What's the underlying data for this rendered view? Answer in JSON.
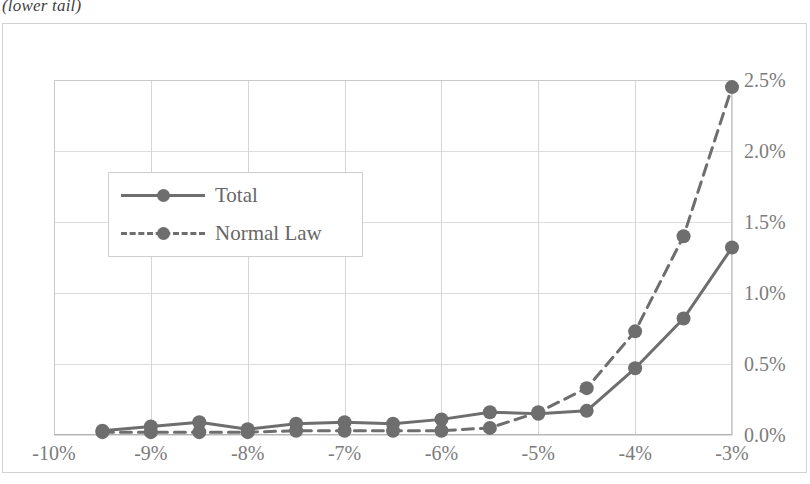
{
  "caption": "(lower tail)",
  "colors": {
    "series": "#6e6e6e",
    "grid": "#dcdcdc",
    "plot_border": "#c9c9c9",
    "frame": "#d2d2d2",
    "tick_text": "#7c7c7c",
    "legend_text": "#676767",
    "background": "#ffffff"
  },
  "legend": {
    "position": "inside-upper-left",
    "items": [
      {
        "label": "Total",
        "style": "solid",
        "marker": "circle"
      },
      {
        "label": "Normal Law",
        "style": "dashed",
        "marker": "circle"
      }
    ]
  },
  "axes": {
    "x_ticks": [
      "-10%",
      "-9%",
      "-8%",
      "-7%",
      "-6%",
      "-5%",
      "-4%",
      "-3%"
    ],
    "y_ticks": [
      "0.0%",
      "0.5%",
      "1.0%",
      "1.5%",
      "2.0%",
      "2.5%"
    ]
  },
  "chart_data": {
    "type": "line",
    "title": "(lower tail)",
    "xlabel": "",
    "ylabel": "",
    "xlim": [
      -10,
      -3
    ],
    "ylim": [
      0,
      2.5
    ],
    "xtick_values": [
      -10,
      -9,
      -8,
      -7,
      -6,
      -5,
      -4,
      -3
    ],
    "xtick_labels": [
      "-10%",
      "-9%",
      "-8%",
      "-7%",
      "-6%",
      "-5%",
      "-4%",
      "-3%"
    ],
    "ytick_values": [
      0.0,
      0.5,
      1.0,
      1.5,
      2.0,
      2.5
    ],
    "ytick_labels": [
      "0.0%",
      "0.5%",
      "1.0%",
      "1.5%",
      "2.0%",
      "2.5%"
    ],
    "grid": true,
    "legend": [
      "Total",
      "Normal Law"
    ],
    "x": [
      -9.5,
      -9.0,
      -8.5,
      -8.0,
      -7.5,
      -7.0,
      -6.5,
      -6.0,
      -5.5,
      -5.0,
      -4.5,
      -4.0,
      -3.5,
      -3.0
    ],
    "series": [
      {
        "name": "Total",
        "style": "solid",
        "marker": "circle",
        "values": [
          0.03,
          0.06,
          0.09,
          0.04,
          0.08,
          0.09,
          0.08,
          0.11,
          0.16,
          0.15,
          0.17,
          0.47,
          0.82,
          1.32
        ]
      },
      {
        "name": "Normal Law",
        "style": "dashed",
        "marker": "circle",
        "values": [
          0.02,
          0.02,
          0.02,
          0.02,
          0.03,
          0.03,
          0.03,
          0.03,
          0.05,
          0.16,
          0.33,
          0.73,
          1.4,
          2.45
        ]
      }
    ]
  }
}
